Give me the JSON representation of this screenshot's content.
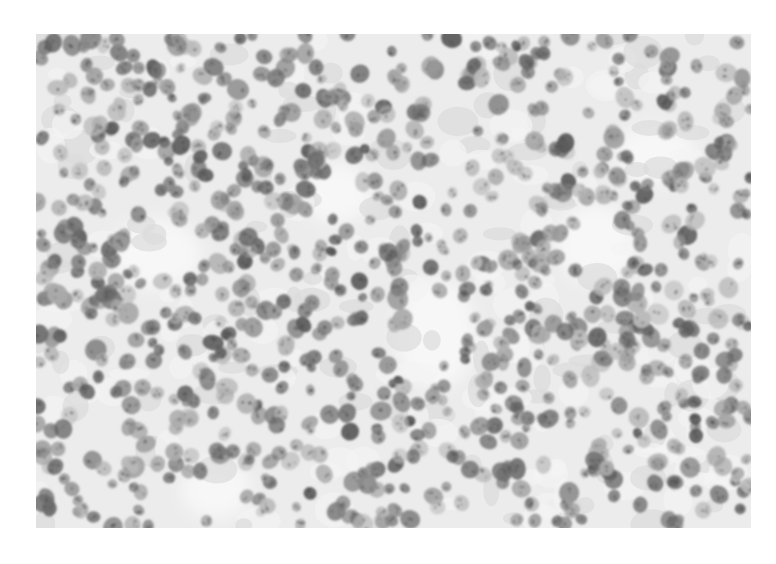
{
  "image": {
    "subject": "grayscale histology micrograph of densely packed round cell nuclei",
    "frame": {
      "left": 36,
      "top": 34,
      "width": 715,
      "height": 494
    },
    "background_color": "#ffffff",
    "tissue_background_color": "#ececec",
    "stroma_color": "#f7f7f7",
    "nucleus_tones": [
      "#5a5a5a",
      "#6b6b6b",
      "#7a7a7a",
      "#888888",
      "#9a9a9a",
      "#aaaaaa",
      "#b8b8b8"
    ],
    "nucleus_count": 900,
    "nucleus_radius_range": [
      5,
      10
    ],
    "pale_regions": [
      {
        "cx": 400,
        "cy": 300,
        "rx": 40,
        "ry": 55
      },
      {
        "cx": 120,
        "cy": 220,
        "rx": 45,
        "ry": 35
      },
      {
        "cx": 560,
        "cy": 210,
        "rx": 40,
        "ry": 40
      },
      {
        "cx": 180,
        "cy": 455,
        "rx": 35,
        "ry": 30
      },
      {
        "cx": 620,
        "cy": 120,
        "rx": 40,
        "ry": 30
      },
      {
        "cx": 300,
        "cy": 160,
        "rx": 35,
        "ry": 30
      }
    ],
    "seed": 7
  }
}
